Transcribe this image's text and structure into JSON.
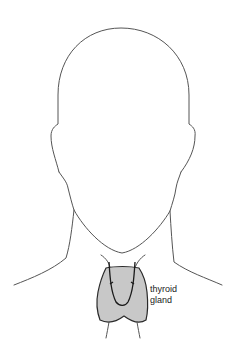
{
  "figure": {
    "highlighted_structure": "thyroid gland",
    "label": {
      "line1": "thyroid",
      "line2": "gland"
    },
    "colors": {
      "background": "#ffffff",
      "outline": "#555555",
      "gland_fill": "#c8c8c8",
      "gland_stroke": "#2a2a2a",
      "label_text": "#222222"
    }
  }
}
